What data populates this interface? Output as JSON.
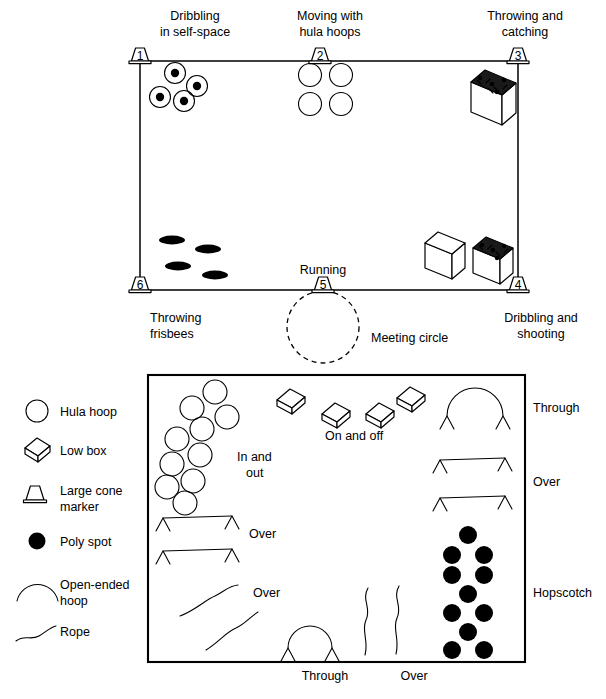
{
  "figure": {
    "field": {
      "name": "outdoor-field-area",
      "stations": [
        {
          "id": 1,
          "cone_number": "1",
          "label_lines": [
            "Dribbling",
            "in self-space"
          ],
          "position": "top-left"
        },
        {
          "id": 2,
          "cone_number": "2",
          "label_lines": [
            "Moving with",
            "hula hoops"
          ],
          "position": "top-center"
        },
        {
          "id": 3,
          "cone_number": "3",
          "label_lines": [
            "Throwing and",
            "catching"
          ],
          "position": "top-right"
        },
        {
          "id": 4,
          "cone_number": "4",
          "label_lines": [
            "Dribbling and",
            "shooting"
          ],
          "position": "bottom-right"
        },
        {
          "id": 5,
          "cone_number": "5",
          "label_lines": [
            "Running"
          ],
          "position": "bottom-center"
        },
        {
          "id": 6,
          "cone_number": "6",
          "label_lines": [
            "Throwing",
            "frisbees"
          ],
          "position": "bottom-left"
        }
      ],
      "meeting_circle_label": "Meeting circle",
      "equipment_counts": {
        "balls_in_hoops": 4,
        "hula_hoops": 4,
        "frisbees": 4,
        "equipment_boxes": 3
      }
    },
    "legend": {
      "name": "symbol-key",
      "items": [
        {
          "symbol": "hula-hoop-icon",
          "label": "Hula hoop"
        },
        {
          "symbol": "low-box-icon",
          "label": "Low box"
        },
        {
          "symbol": "large-cone-marker-icon",
          "label": "Large cone\nmarker",
          "label_lines": [
            "Large cone",
            "marker"
          ]
        },
        {
          "symbol": "poly-spot-icon",
          "label": "Poly spot"
        },
        {
          "symbol": "open-ended-hoop-icon",
          "label": "Open-ended\nhoop",
          "label_lines": [
            "Open-ended",
            "hoop"
          ]
        },
        {
          "symbol": "rope-icon",
          "label": "Rope"
        }
      ]
    },
    "obstacle_course": {
      "name": "indoor-obstacle-course",
      "tasks": [
        {
          "id": "in-and-out",
          "label_lines": [
            "In and",
            "out"
          ],
          "equipment": "hula hoops",
          "count": 10
        },
        {
          "id": "on-and-off",
          "label_lines": [
            "On and off"
          ],
          "equipment": "low boxes",
          "count": 4
        },
        {
          "id": "through-hoop",
          "label_lines": [
            "Through"
          ],
          "equipment": "open-ended hoop on cones",
          "count": 1
        },
        {
          "id": "over-ropes-right",
          "label_lines": [
            "Over"
          ],
          "equipment": "ropes on cones",
          "count": 2
        },
        {
          "id": "over-ropes-left",
          "label_lines": [
            "Over"
          ],
          "equipment": "ropes on cones",
          "count": 2
        },
        {
          "id": "over-loose-ropes",
          "label_lines": [
            "Over"
          ],
          "equipment": "loose ropes",
          "count": 2
        },
        {
          "id": "hopscotch",
          "label_lines": [
            "Hopscotch"
          ],
          "equipment": "poly spots",
          "count": 11
        },
        {
          "id": "through-bottom",
          "label_lines": [
            "Through"
          ],
          "equipment": "open-ended hoop on cones",
          "count": 1
        },
        {
          "id": "over-bottom",
          "label_lines": [
            "Over"
          ],
          "equipment": "loose ropes",
          "count": 2
        }
      ]
    }
  },
  "colors": {
    "ink": "#000000",
    "paper": "#ffffff",
    "dark_fill": "#1a1a1a"
  }
}
